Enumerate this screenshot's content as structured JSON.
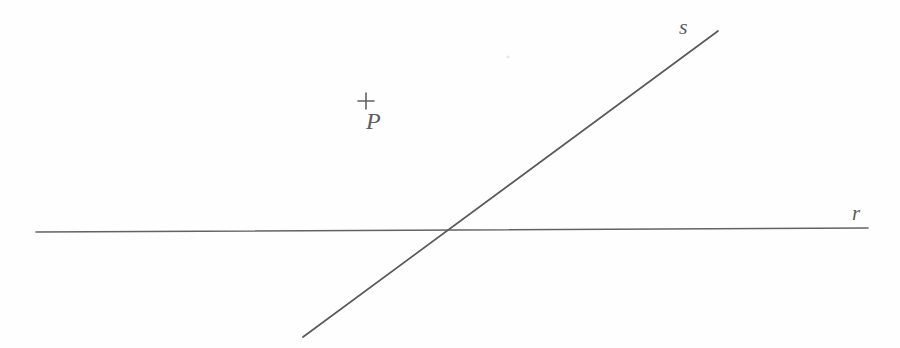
{
  "figure": {
    "type": "geometry-diagram",
    "background_color": "#fefefe",
    "stroke_color": "#5f5f5f",
    "label_color": "#5d5d5d",
    "width": 900,
    "height": 348
  },
  "lines": [
    {
      "id": "line-r",
      "label": "r",
      "orientation": "horizontal",
      "x1": 36,
      "y1": 232,
      "x2": 868,
      "y2": 228,
      "stroke_width": 1.6,
      "label_x": 860,
      "label_y": 214
    },
    {
      "id": "line-s",
      "label": "s",
      "orientation": "diagonal",
      "x1": 303,
      "y1": 337,
      "x2": 718,
      "y2": 31,
      "stroke_width": 1.7,
      "label_x": 688,
      "label_y": 30
    }
  ],
  "points": [
    {
      "id": "point-p",
      "label": "P",
      "marker": "plus-cross",
      "x": 366,
      "y": 101,
      "marker_size": 16,
      "label_x": 375,
      "label_y": 121
    }
  ],
  "intersection": {
    "id": "intersection-r-s",
    "x": 445,
    "y": 231,
    "visible_marker": false
  },
  "artifacts": [
    {
      "id": "scan-speck",
      "x": 508,
      "y": 57,
      "size": 3
    }
  ]
}
